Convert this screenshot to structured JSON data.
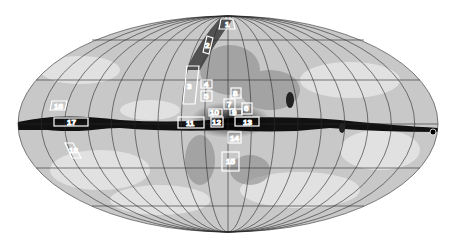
{
  "map": {
    "projection": "all-sky-ellipse",
    "colors": {
      "background": "#ffffff",
      "grid": "#2a2a2a",
      "box": "#ffffff",
      "plane": "#111111",
      "diffuse": "#bdbdbd"
    },
    "regions": [
      {
        "id": "1",
        "label": "1"
      },
      {
        "id": "2",
        "label": "2"
      },
      {
        "id": "3",
        "label": "3"
      },
      {
        "id": "4",
        "label": "4"
      },
      {
        "id": "5",
        "label": "5"
      },
      {
        "id": "6",
        "label": "6"
      },
      {
        "id": "7",
        "label": "7"
      },
      {
        "id": "8",
        "label": "8"
      },
      {
        "id": "9",
        "label": "9"
      },
      {
        "id": "10",
        "label": "10"
      },
      {
        "id": "11",
        "label": "11"
      },
      {
        "id": "12",
        "label": "12"
      },
      {
        "id": "13",
        "label": "13"
      },
      {
        "id": "14",
        "label": "14"
      },
      {
        "id": "15",
        "label": "15"
      },
      {
        "id": "16",
        "label": "16"
      },
      {
        "id": "17",
        "label": "17"
      },
      {
        "id": "18",
        "label": "18"
      }
    ]
  }
}
